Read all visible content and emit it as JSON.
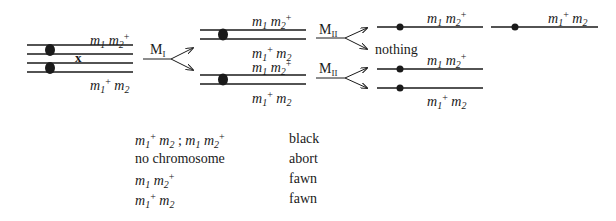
{
  "diagram": {
    "parental": {
      "top_label": {
        "m1": "m",
        "s1": "1",
        "m2": "m",
        "s2": "2",
        "sup2": "+"
      },
      "bottom_label": {
        "m1": "m",
        "s1": "1",
        "sup1": "+",
        "m2": "m",
        "s2": "2"
      },
      "crossover_mark": "x"
    },
    "meiosis_I": {
      "label": "M",
      "sub": "I"
    },
    "meiosis_II_top": {
      "label": "M",
      "sub": "II"
    },
    "meiosis_II_bottom": {
      "label": "M",
      "sub": "II"
    },
    "middle_top": {
      "top_label": {
        "m1": "m",
        "s1": "1",
        "m2": "m",
        "s2": "2",
        "sup2": "+"
      },
      "bottom_label": {
        "m1": "m",
        "s1": "1",
        "sup1": "+",
        "m2": "m",
        "s2": "2"
      }
    },
    "middle_bottom": {
      "top_label": {
        "m1": "m",
        "s1": "1",
        "m2": "m",
        "s2": "2",
        "sup2": "+"
      },
      "bottom_label": {
        "m1": "m",
        "s1": "1",
        "sup1": "+",
        "m2": "m",
        "s2": "2"
      }
    },
    "products": {
      "p1_label": {
        "m1": "m",
        "s1": "1",
        "m2": "m",
        "s2": "2",
        "sup2": "+"
      },
      "p2_label": {
        "m1": "m",
        "s1": "1",
        "sup1": "+",
        "m2": "m",
        "s2": "2"
      },
      "nothing": "nothing",
      "p3_label": {
        "m1": "m",
        "s1": "1",
        "m2": "m",
        "s2": "2",
        "sup2": "+"
      },
      "p4_label": {
        "m1": "m",
        "s1": "1",
        "sup1": "+",
        "m2": "m",
        "s2": "2"
      }
    }
  },
  "legend": {
    "rows": [
      {
        "genotype_a": {
          "m1": "m",
          "s1": "1",
          "sup1": "+",
          "m2": "m",
          "s2": "2"
        },
        "separator": " ; ",
        "genotype_b": {
          "m1": "m",
          "s1": "1",
          "m2": "m",
          "s2": "2",
          "sup2": "+"
        },
        "phenotype": "black"
      },
      {
        "genotype_text": "no chromosome",
        "phenotype": "abort"
      },
      {
        "genotype_a": {
          "m1": "m",
          "s1": "1",
          "m2": "m",
          "s2": "2",
          "sup2": "+"
        },
        "phenotype": "fawn"
      },
      {
        "genotype_a": {
          "m1": "m",
          "s1": "1",
          "sup1": "+",
          "m2": "m",
          "s2": "2"
        },
        "phenotype": "fawn"
      }
    ]
  },
  "colors": {
    "ink": "#1a1a1a",
    "background": "#ffffff"
  }
}
